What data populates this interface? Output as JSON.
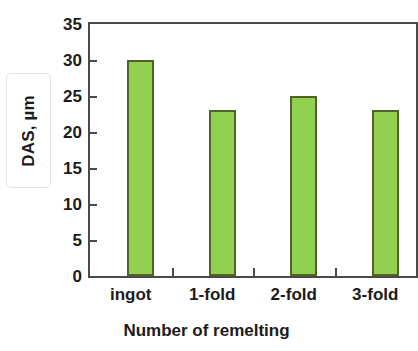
{
  "chart_data": {
    "type": "bar",
    "title": "",
    "subtitle": "",
    "categories": [
      "ingot",
      "1-fold",
      "2-fold",
      "3-fold"
    ],
    "values": [
      30,
      23,
      25,
      23
    ],
    "series": [
      {
        "name": "DAS",
        "values": [
          30,
          23,
          25,
          23
        ]
      }
    ],
    "xlabel": "Number of remelting",
    "ylabel": "DAS, µm",
    "ylim": [
      0,
      35
    ],
    "ytick_labels": [
      "35",
      "30",
      "25",
      "20",
      "15",
      "10",
      "5",
      "0"
    ],
    "ytick_values": [
      35,
      30,
      25,
      20,
      15,
      10,
      5,
      0
    ],
    "ytick_step": 5,
    "grid": false,
    "legend": false,
    "legend_position": "none",
    "annotations": [],
    "colors": {
      "bar_fill": "#92d14f",
      "bar_border": "#4f6228",
      "axis": "#4a4a4a",
      "text": "#1c1c1c",
      "label_box_border": "#e2e2e2",
      "background": "#ffffff"
    }
  },
  "axes": {
    "y_title": "DAS, µm",
    "x_title": "Number of remelting"
  }
}
